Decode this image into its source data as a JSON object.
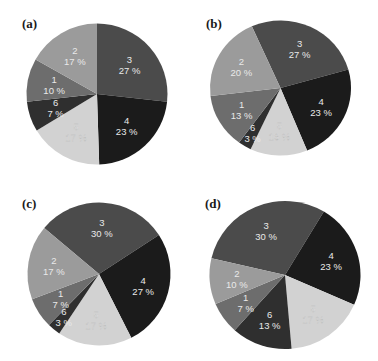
{
  "chart_data": [
    {
      "type": "pie",
      "panel": "(a)",
      "title": "",
      "start_angle_deg": 0,
      "direction": "clockwise",
      "slices": [
        {
          "label": "3",
          "value": 27,
          "text": "27 %",
          "color": "#4b4b4b"
        },
        {
          "label": "4",
          "value": 23,
          "text": "23 %",
          "color": "#1b1b1b"
        },
        {
          "label": "5",
          "value": 17,
          "text": "17 %",
          "color": "#d2d2d2"
        },
        {
          "label": "6",
          "value": 7,
          "text": "7 %",
          "color": "#2f2f2f"
        },
        {
          "label": "1",
          "value": 10,
          "text": "10 %",
          "color": "#6d6d6d"
        },
        {
          "label": "2",
          "value": 17,
          "text": "17 %",
          "color": "#9b9b9b"
        }
      ]
    },
    {
      "type": "pie",
      "panel": "(b)",
      "title": "",
      "start_angle_deg": -24,
      "direction": "clockwise",
      "slices": [
        {
          "label": "3",
          "value": 27,
          "text": "27 %",
          "color": "#4b4b4b"
        },
        {
          "label": "4",
          "value": 23,
          "text": "23 %",
          "color": "#1b1b1b"
        },
        {
          "label": "5",
          "value": 13,
          "text": "13 %",
          "color": "#d2d2d2"
        },
        {
          "label": "6",
          "value": 3,
          "text": "3 %",
          "color": "#2f2f2f"
        },
        {
          "label": "1",
          "value": 13,
          "text": "13 %",
          "color": "#6d6d6d"
        },
        {
          "label": "2",
          "value": 20,
          "text": "20 %",
          "color": "#9b9b9b"
        }
      ]
    },
    {
      "type": "pie",
      "panel": "(c)",
      "title": "",
      "start_angle_deg": -50,
      "direction": "clockwise",
      "slices": [
        {
          "label": "3",
          "value": 30,
          "text": "30 %",
          "color": "#4b4b4b"
        },
        {
          "label": "4",
          "value": 27,
          "text": "27 %",
          "color": "#1b1b1b"
        },
        {
          "label": "5",
          "value": 17,
          "text": "17 %",
          "color": "#d2d2d2"
        },
        {
          "label": "6",
          "value": 3,
          "text": "3 %",
          "color": "#2f2f2f"
        },
        {
          "label": "1",
          "value": 7,
          "text": "7 %",
          "color": "#6d6d6d"
        },
        {
          "label": "2",
          "value": 17,
          "text": "17 %",
          "color": "#9b9b9b"
        }
      ]
    },
    {
      "type": "pie",
      "panel": "(d)",
      "title": "",
      "start_angle_deg": -77,
      "direction": "clockwise",
      "slices": [
        {
          "label": "3",
          "value": 30,
          "text": "30 %",
          "color": "#4b4b4b"
        },
        {
          "label": "4",
          "value": 23,
          "text": "23 %",
          "color": "#1b1b1b"
        },
        {
          "label": "5",
          "value": 17,
          "text": "17 %",
          "color": "#d2d2d2"
        },
        {
          "label": "6",
          "value": 13,
          "text": "13 %",
          "color": "#2f2f2f"
        },
        {
          "label": "1",
          "value": 7,
          "text": "7 %",
          "color": "#6d6d6d"
        },
        {
          "label": "2",
          "value": 10,
          "text": "10 %",
          "color": "#9b9b9b"
        }
      ]
    }
  ],
  "panels": {
    "a": {
      "label": "(a)"
    },
    "b": {
      "label": "(b)"
    },
    "c": {
      "label": "(c)"
    },
    "d": {
      "label": "(d)"
    }
  }
}
